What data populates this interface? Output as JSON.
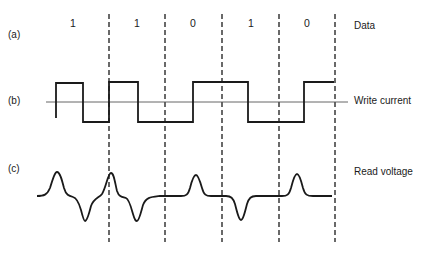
{
  "diagram": {
    "rows": [
      {
        "id": "a",
        "tag": "(a)",
        "label": "Data"
      },
      {
        "id": "b",
        "tag": "(b)",
        "label": "Write current"
      },
      {
        "id": "c",
        "tag": "(c)",
        "label": "Read voltage"
      }
    ],
    "data_bits": [
      "1",
      "1",
      "0",
      "1",
      "0"
    ],
    "write_current_levels": [
      1,
      -1,
      1,
      -1,
      1,
      1,
      -1,
      -1,
      1
    ],
    "read_voltage_pulses": [
      {
        "bit_cell": 0,
        "polarity": "positive",
        "at": "start"
      },
      {
        "bit_cell": 0,
        "polarity": "negative",
        "at": "middle"
      },
      {
        "bit_cell": 1,
        "polarity": "positive",
        "at": "start"
      },
      {
        "bit_cell": 1,
        "polarity": "negative",
        "at": "middle"
      },
      {
        "bit_cell": 2,
        "polarity": "positive",
        "at": "middle"
      },
      {
        "bit_cell": 3,
        "polarity": "negative",
        "at": "middle"
      },
      {
        "bit_cell": 4,
        "polarity": "positive",
        "at": "middle"
      }
    ],
    "colors": {
      "ink": "#1a1a1a",
      "axis": "#555555"
    }
  }
}
